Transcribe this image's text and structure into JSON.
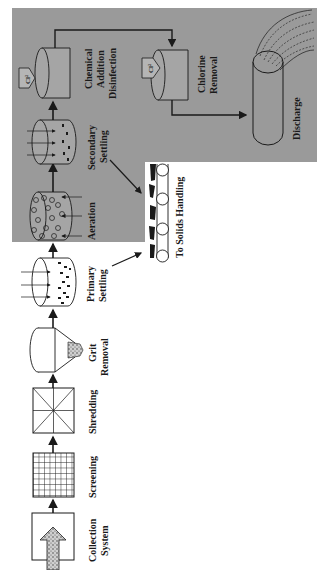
{
  "diagram": {
    "orientation": "rotated-90-ccw",
    "colors": {
      "background": "#ffffff",
      "secondary_panel": "#9a9a9a",
      "line": "#1a1a1a"
    },
    "stages": [
      {
        "id": "collection",
        "label_lines": [
          "Collection",
          "System"
        ]
      },
      {
        "id": "screening",
        "label_lines": [
          "Screening"
        ]
      },
      {
        "id": "shredding",
        "label_lines": [
          "Shredding"
        ]
      },
      {
        "id": "grit",
        "label_lines": [
          "Grit",
          "Removal"
        ]
      },
      {
        "id": "primary",
        "label_lines": [
          "Primary",
          "Settling"
        ]
      },
      {
        "id": "aeration",
        "label_lines": [
          "Aeration"
        ]
      },
      {
        "id": "secondary",
        "label_lines": [
          "Secondary",
          "Settling"
        ]
      },
      {
        "id": "disinfection",
        "label_lines": [
          "Chemical",
          "Addition",
          "Disinfection"
        ]
      },
      {
        "id": "chlorine_removal",
        "label_lines": [
          "Chlorine",
          "Removal"
        ]
      },
      {
        "id": "discharge",
        "label_lines": [
          "Discharge"
        ]
      }
    ],
    "solids": {
      "label": "To Solids Handling"
    },
    "chemical_tag": "Cl²"
  }
}
